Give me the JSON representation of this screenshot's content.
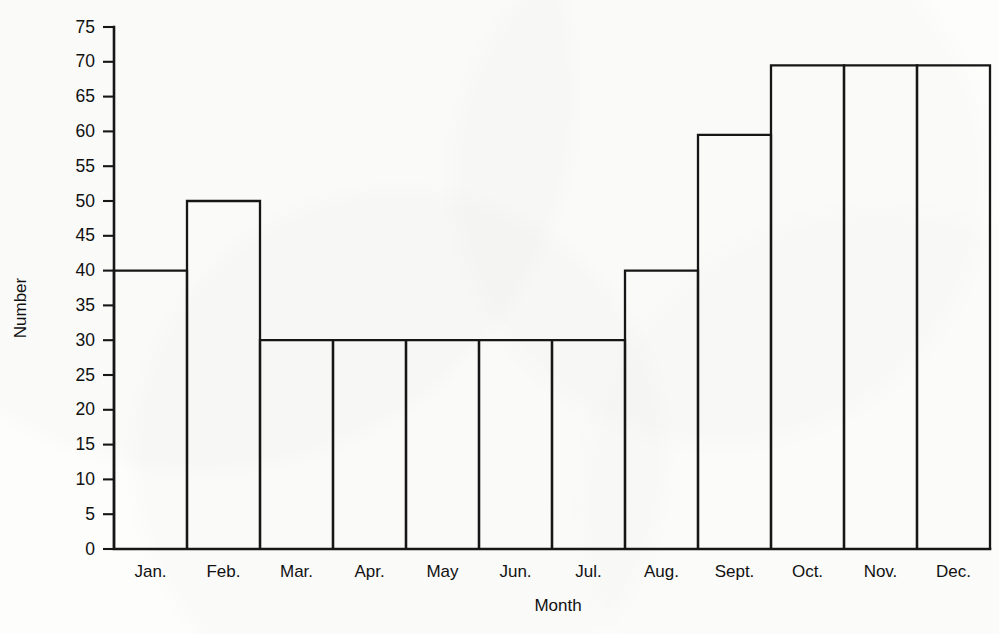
{
  "chart_data": {
    "type": "bar",
    "title": "",
    "subtitle": "",
    "xlabel": "Month",
    "ylabel": "Number",
    "categories": [
      "Jan.",
      "Feb.",
      "Mar.",
      "Apr.",
      "May",
      "Jun.",
      "Jul.",
      "Aug.",
      "Sept.",
      "Oct.",
      "Nov.",
      "Dec."
    ],
    "values": [
      40,
      50,
      30,
      30,
      30,
      30,
      30,
      40,
      59.5,
      69.5,
      69.5,
      69.5
    ],
    "ylim": [
      0,
      75
    ],
    "ytick_step": 5,
    "yticks": [
      0,
      5,
      10,
      15,
      20,
      25,
      30,
      35,
      40,
      45,
      50,
      55,
      60,
      65,
      70,
      75
    ],
    "ytick_labels": [
      "0",
      "5",
      "10",
      "15",
      "20",
      "25",
      "30",
      "35",
      "40",
      "45",
      "50",
      "55",
      "60",
      "65",
      "70",
      "75"
    ],
    "grid": false,
    "legend": null,
    "legend_position": "none",
    "bar_style": "outline",
    "bar_gap": 0,
    "annotations": [],
    "colors": {
      "bar_stroke": "#161616",
      "bar_fill": "none",
      "axis": "#161616",
      "text": "#111111",
      "background": "#fdfdfc"
    }
  }
}
